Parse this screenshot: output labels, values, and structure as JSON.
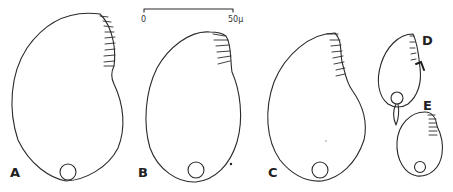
{
  "figure": {
    "panels": [
      {
        "id": "A",
        "label": "A"
      },
      {
        "id": "B",
        "label": "B"
      },
      {
        "id": "C",
        "label": "C"
      },
      {
        "id": "D",
        "label": "D"
      },
      {
        "id": "E",
        "label": "E"
      }
    ],
    "scale_bar": {
      "start_label": "0",
      "end_label": "50μ",
      "length_value": 50,
      "unit": "μ"
    }
  }
}
